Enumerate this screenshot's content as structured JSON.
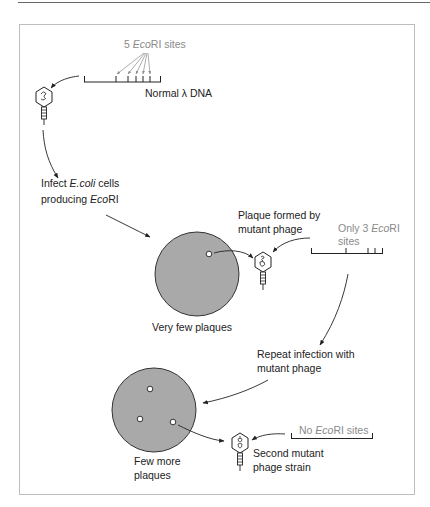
{
  "diagram": {
    "colors": {
      "ink": "#222222",
      "gray_text": "#8a8a8a",
      "plate_fill": "#a9a9a9",
      "plate_stroke": "#333333",
      "frame": "#bdbdbd",
      "rule": "#666666"
    },
    "stage1": {
      "sites_label": {
        "prefix": "5 ",
        "enzyme_italic": "Eco",
        "enzyme_rest": "RI sites"
      },
      "dna_label": "Normal λ DNA",
      "site_count": 5
    },
    "stage2": {
      "infect_line1_prefix": "Infect ",
      "infect_line1_italic": "E.coli",
      "infect_line1_suffix": " cells",
      "infect_line2_prefix": "producing ",
      "infect_line2_italic": "Eco",
      "infect_line2_suffix": "RI",
      "plate_label": "Very few plaques",
      "plaque_count": 1
    },
    "stage3": {
      "plaque_label_line1": "Plaque formed by",
      "plaque_label_line2": "mutant phage",
      "sites_line1_prefix": "Only 3 ",
      "sites_line1_italic": "Eco",
      "sites_line1_suffix": "RI",
      "sites_line2": "sites",
      "site_count": 3
    },
    "stage4": {
      "repeat_line1": "Repeat infection with",
      "repeat_line2": "mutant phage",
      "plate_label_line1": "Few more",
      "plate_label_line2": "plaques",
      "plaque_count": 3
    },
    "stage5": {
      "sites_prefix": "No ",
      "sites_italic": "Eco",
      "sites_suffix": "RI sites",
      "strain_line1": "Second mutant",
      "strain_line2": "phage strain",
      "site_count": 0
    },
    "icons": [
      "phage-icon",
      "petri-plate-icon",
      "plaque-icon",
      "dna-restriction-map-icon",
      "arrow-icon"
    ]
  }
}
